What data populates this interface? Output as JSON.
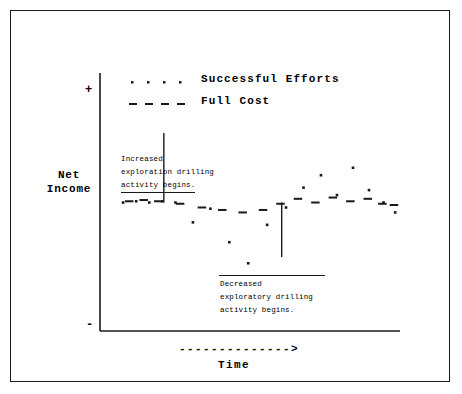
{
  "chart_data": {
    "type": "scatter",
    "title": "",
    "xlabel": "Time",
    "ylabel": "Net Income",
    "grid": false,
    "legend_position": "top-center",
    "xlim": [
      0,
      100
    ],
    "ylim": [
      -100,
      100
    ],
    "y_tick_labels": [
      "+",
      "-"
    ],
    "x_axis_arrow": "-------------->",
    "series": [
      {
        "name": "Successful Efforts",
        "marker": "dot",
        "x": [
          4.5,
          9.0,
          13.5,
          18.0,
          22.5,
          28.5,
          34.5,
          41.0,
          47.5,
          54.0,
          60.5,
          66.5,
          72.5,
          78.0,
          83.5,
          89.0,
          94.0,
          98.0
        ],
        "y": [
          2,
          3,
          2,
          3,
          2,
          -14,
          -3,
          -30,
          -47,
          -16,
          -2,
          14,
          24,
          8,
          30,
          12,
          2,
          -6
        ]
      },
      {
        "name": "Full Cost",
        "marker": "dash",
        "x": [
          6.5,
          11.5,
          16.5,
          24.0,
          31.5,
          38.5,
          45.5,
          52.5,
          58.5,
          64.5,
          70.5,
          76.5,
          82.5,
          88.5,
          93.5,
          97.5
        ],
        "y": [
          3,
          4,
          3,
          1,
          -2,
          -4,
          -6,
          -4,
          1,
          5,
          2,
          6,
          3,
          5,
          1,
          0
        ]
      }
    ],
    "annotations": [
      {
        "id": "increased-drilling",
        "lines": [
          "Increased",
          "exploration drilling",
          "activity begins."
        ],
        "underline_last_line": true,
        "overline": false,
        "connector_x": 18.5,
        "connector_from_y": 58,
        "connector_to_y": 2
      },
      {
        "id": "decreased-drilling",
        "lines": [
          "Decreased",
          "exploratory drilling",
          "activity begins."
        ],
        "underline_last_line": false,
        "overline": true,
        "connector_x": 59.0,
        "connector_from_y": 2,
        "connector_to_y": -42
      }
    ]
  },
  "legend": {
    "entries": [
      {
        "label": "Successful Efforts",
        "marker": "dot"
      },
      {
        "label": "Full Cost",
        "marker": "dash"
      }
    ]
  },
  "axes": {
    "y_label_line1": "Net",
    "y_label_line2": "Income",
    "y_top_sign": "+",
    "y_bottom_sign": "-",
    "x_label": "Time",
    "x_arrow": "-------------->"
  },
  "annotation_1": {
    "line1": "Increased",
    "line2": "exploration drilling",
    "line3": "activity begins."
  },
  "annotation_2": {
    "line1": "Decreased",
    "line2": "exploratory drilling",
    "line3": "activity begins."
  },
  "colors": {
    "ink": "#1a1a1a",
    "border": "#1a1a1a",
    "background": "#ffffff"
  }
}
